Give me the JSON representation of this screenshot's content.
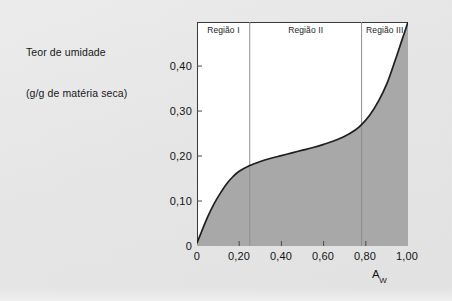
{
  "figure": {
    "y_axis_caption_line1": "Teor de umidade",
    "y_axis_caption_line2": "(g/g de matéria seca)",
    "x_axis_title_base": "A",
    "x_axis_title_sub": "W"
  },
  "regions": [
    {
      "label": "Região I"
    },
    {
      "label": "Região II"
    },
    {
      "label": "Região III"
    }
  ],
  "axes": {
    "y_ticks": [
      "0,40",
      "0,30",
      "0,20",
      "0,10",
      "0"
    ],
    "x_ticks": [
      "0",
      "0,20",
      "0,40",
      "0,60",
      "0,80",
      "1,00"
    ]
  },
  "colors": {
    "page_background": "#e8e8e8",
    "plot_background": "#ffffff",
    "curve": "#1d1f21",
    "fill": "#a8a8a8",
    "frame": "#3a3a3a",
    "divider": "#8e8e8e",
    "text": "#131517"
  },
  "chart_data": {
    "type": "area",
    "title": "",
    "xlabel": "Aw",
    "ylabel": "Teor de umidade (g/g de matéria seca)",
    "xlim": [
      0,
      1.0
    ],
    "ylim": [
      0,
      0.498
    ],
    "grid": false,
    "legend": "none",
    "x_tick_values": [
      0,
      0.2,
      0.4,
      0.6,
      0.8,
      1.0
    ],
    "y_tick_values": [
      0,
      0.1,
      0.2,
      0.3,
      0.4
    ],
    "annotations": [
      {
        "text": "Região I",
        "x_range": [
          0.0,
          0.25
        ]
      },
      {
        "text": "Região II",
        "x_range": [
          0.25,
          0.78
        ]
      },
      {
        "text": "Região III",
        "x_range": [
          0.78,
          1.0
        ]
      }
    ],
    "region_boundaries": [
      0.25,
      0.78
    ],
    "series": [
      {
        "name": "Isoterma de sorção",
        "x": [
          0.0,
          0.02,
          0.05,
          0.08,
          0.11,
          0.14,
          0.17,
          0.2,
          0.25,
          0.3,
          0.35,
          0.4,
          0.45,
          0.5,
          0.55,
          0.6,
          0.65,
          0.7,
          0.75,
          0.78,
          0.82,
          0.86,
          0.9,
          0.94,
          0.97,
          1.0
        ],
        "y": [
          0.007,
          0.03,
          0.064,
          0.093,
          0.117,
          0.138,
          0.154,
          0.166,
          0.179,
          0.188,
          0.195,
          0.201,
          0.207,
          0.213,
          0.219,
          0.226,
          0.234,
          0.244,
          0.258,
          0.27,
          0.292,
          0.322,
          0.361,
          0.414,
          0.456,
          0.498
        ]
      }
    ]
  }
}
